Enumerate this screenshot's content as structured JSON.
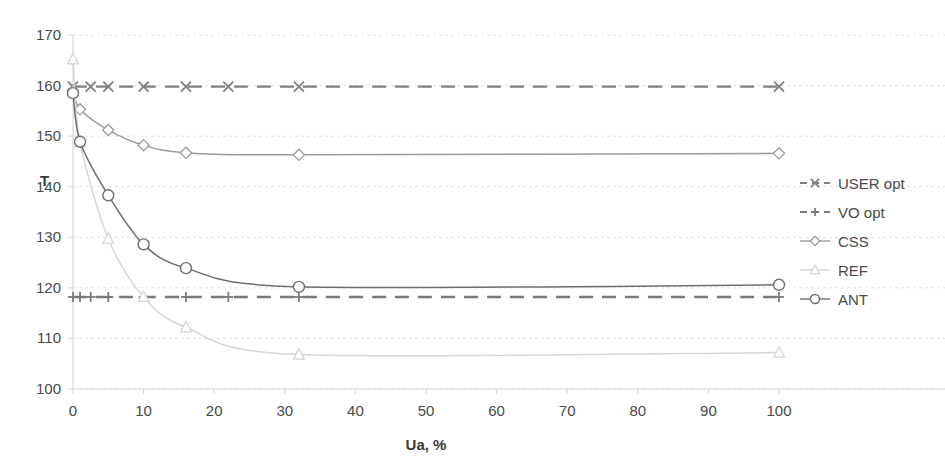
{
  "chart_data": {
    "type": "line",
    "title": "",
    "subtitle": "",
    "xlabel": "Ua, %",
    "ylabel": "T",
    "xlim": [
      0,
      100
    ],
    "ylim": [
      100,
      170
    ],
    "xticks": [
      0,
      10,
      20,
      30,
      40,
      50,
      60,
      70,
      80,
      90,
      100
    ],
    "xtick_labels": [
      "0",
      "10",
      "20",
      "30",
      "40",
      "50",
      "60",
      "70",
      "80",
      "90",
      "100"
    ],
    "yticks": [
      100,
      110,
      120,
      130,
      140,
      150,
      160,
      170
    ],
    "ytick_labels": [
      "100",
      "110",
      "120",
      "130",
      "140",
      "150",
      "160",
      "170"
    ],
    "grid": true,
    "grid_axis": "y",
    "legend_position": "right",
    "series": [
      {
        "name": "USER opt",
        "marker": "x",
        "linestyle": "dashed",
        "color": "#808080",
        "x": [
          0,
          1,
          2.5,
          5,
          7.5,
          10,
          16,
          22,
          32,
          45,
          60,
          75,
          90,
          100
        ],
        "y": [
          159.8,
          159.8,
          159.8,
          159.8,
          159.8,
          159.8,
          159.8,
          159.8,
          159.8,
          159.8,
          159.8,
          159.8,
          159.8,
          159.8
        ],
        "marker_x": [
          0,
          2.5,
          5,
          10,
          16,
          22,
          32,
          100
        ],
        "value": 159.8
      },
      {
        "name": "VO opt",
        "marker": "plus",
        "linestyle": "dashed",
        "color": "#7a7a7a",
        "x": [
          0,
          1,
          2.5,
          5,
          7.5,
          10,
          16,
          22,
          32,
          45,
          60,
          75,
          90,
          100
        ],
        "y": [
          118.2,
          118.2,
          118.2,
          118.2,
          118.2,
          118.2,
          118.2,
          118.2,
          118.2,
          118.2,
          118.2,
          118.2,
          118.2,
          118.2
        ],
        "marker_x": [
          0,
          1,
          2.5,
          5,
          10,
          16,
          22,
          32,
          100
        ],
        "value": 118.2
      },
      {
        "name": "CSS",
        "marker": "diamond",
        "linestyle": "solid",
        "color": "#9a9a9a",
        "x": [
          0,
          1,
          5,
          10,
          16,
          32,
          100
        ],
        "y": [
          159.0,
          155.3,
          151.2,
          148.2,
          146.7,
          146.3,
          146.6
        ]
      },
      {
        "name": "REF",
        "marker": "triangle",
        "linestyle": "solid",
        "color": "#d6d6d6",
        "x": [
          0,
          1,
          5,
          10,
          16,
          32,
          100
        ],
        "y": [
          165.2,
          148.8,
          129.7,
          118.2,
          112.2,
          106.8,
          107.2
        ]
      },
      {
        "name": "ANT",
        "marker": "circle",
        "linestyle": "solid",
        "color": "#6e6e6e",
        "x": [
          0,
          1,
          5,
          10,
          16,
          32,
          100
        ],
        "y": [
          158.5,
          148.9,
          138.3,
          128.6,
          123.9,
          120.2,
          120.6
        ]
      }
    ]
  },
  "legend": {
    "items": [
      {
        "label": "USER opt"
      },
      {
        "label": "VO opt"
      },
      {
        "label": "CSS"
      },
      {
        "label": "REF"
      },
      {
        "label": "ANT"
      }
    ]
  },
  "axes": {
    "y_title": "T",
    "x_title": "Ua, %"
  },
  "colors": {
    "user_opt": "#808080",
    "vo_opt": "#7a7a7a",
    "css": "#9a9a9a",
    "ref": "#d6d6d6",
    "ant": "#6e6e6e",
    "grid": "#e2e2e2",
    "text": "#4a4a4a"
  }
}
